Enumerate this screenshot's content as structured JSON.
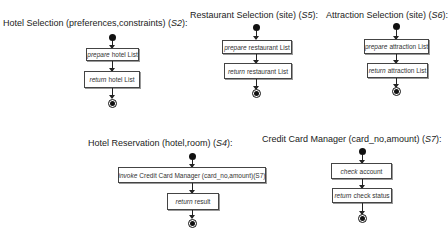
{
  "diagrams": [
    {
      "id": "S2",
      "title_prefix": "Hotel Selection (preferences,constraints) (",
      "title_code": "S2",
      "title_suffix": "):",
      "actions": [
        {
          "verb": "prepare",
          "rest": "hotel List"
        },
        {
          "verb": "return",
          "rest": "hotel List"
        }
      ]
    },
    {
      "id": "S5",
      "title_prefix": "Restaurant Selection (site) (",
      "title_code": "S5",
      "title_suffix": "):",
      "actions": [
        {
          "verb": "prepare",
          "rest": "restaurant List"
        },
        {
          "verb": "return",
          "rest": "restaurant List"
        }
      ]
    },
    {
      "id": "S6",
      "title_prefix": "Attraction Selection (site) (",
      "title_code": "S6",
      "title_suffix": "):",
      "actions": [
        {
          "verb": "prepare",
          "rest": "attraction List"
        },
        {
          "verb": "return",
          "rest": "attraction List"
        }
      ]
    },
    {
      "id": "S4",
      "title_prefix": "Hotel Reservation (hotel,room) (",
      "title_code": "S4",
      "title_suffix": "):",
      "actions": [
        {
          "verb": "invoke",
          "rest": "Credit Card Manager (card_no,amount)(S7)"
        },
        {
          "verb": "return",
          "rest": "result"
        }
      ]
    },
    {
      "id": "S7",
      "title_prefix": "Credit Card Manager (card_no,amount) (",
      "title_code": "S7",
      "title_suffix": "):",
      "actions": [
        {
          "verb": "check",
          "rest": "account"
        },
        {
          "verb": "return",
          "rest": "check status"
        }
      ]
    }
  ]
}
